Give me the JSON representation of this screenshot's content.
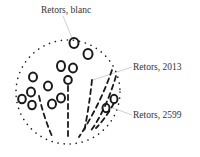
{
  "diagram": {
    "type": "labeled illustration",
    "labels": [
      {
        "id": "blanc",
        "text": "Retors, blanc"
      },
      {
        "id": "2013",
        "text": "Retors, 2013"
      },
      {
        "id": "2599",
        "text": "Retors, 2599"
      }
    ],
    "colors": {
      "stroke": "#1a1a1a",
      "leader": "#aaaaaa",
      "text": "#333333",
      "background": "#ffffff"
    }
  }
}
